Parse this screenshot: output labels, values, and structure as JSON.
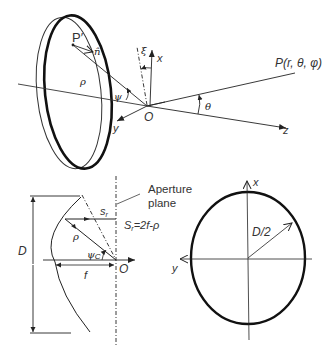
{
  "top_figure": {
    "labels": {
      "p_prime": "P′",
      "n_hat": "n̂",
      "rho": "ρ",
      "psi": "ψ",
      "xi": "ξ",
      "x": "x",
      "y": "y",
      "z": "z",
      "origin": "O",
      "theta": "θ",
      "far_point": "P(r, θ, φ)"
    }
  },
  "side_view": {
    "labels": {
      "D": "D",
      "rho": "ρ",
      "s_r": "s",
      "s_r_sub": "r",
      "psi_c": "ψ",
      "psi_c_sub": "C",
      "f": "f",
      "origin": "O",
      "aperture_line1": "Aperture",
      "aperture_line2": "plane",
      "eq_S": "S",
      "eq_sub": "r",
      "eq_rhs": "=2f-ρ"
    }
  },
  "aperture_view": {
    "labels": {
      "x": "x",
      "y": "y",
      "radius": "D/2"
    }
  },
  "colors": {
    "ink": "#222222",
    "background": "#ffffff"
  }
}
